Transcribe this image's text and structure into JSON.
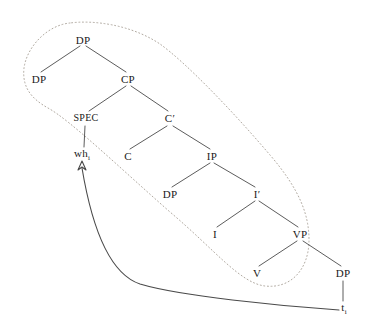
{
  "diagram": {
    "type": "syntax-tree",
    "background_color": "#ffffff",
    "line_color": "#4a4a4a",
    "dotted_color": "#b0a9a0",
    "text_color": "#1a1a1a"
  },
  "nodes": [
    {
      "id": "dp-root",
      "label": "DP",
      "sub": "",
      "x": 83,
      "y": 40
    },
    {
      "id": "dp-left",
      "label": "DP",
      "sub": "",
      "x": 39,
      "y": 79
    },
    {
      "id": "cp",
      "label": "CP",
      "sub": "",
      "x": 128,
      "y": 79
    },
    {
      "id": "spec",
      "label": "SPEC",
      "sub": "",
      "x": 86,
      "y": 118
    },
    {
      "id": "cbar",
      "label": "C′",
      "sub": "",
      "x": 170,
      "y": 118
    },
    {
      "id": "wh",
      "label": "wh",
      "sub": "i",
      "x": 82,
      "y": 155
    },
    {
      "id": "c",
      "label": "C",
      "sub": "",
      "x": 128,
      "y": 156
    },
    {
      "id": "ip",
      "label": "IP",
      "sub": "",
      "x": 212,
      "y": 156
    },
    {
      "id": "dp-subj",
      "label": "DP",
      "sub": "",
      "x": 170,
      "y": 194
    },
    {
      "id": "ibar",
      "label": "I′",
      "sub": "",
      "x": 257,
      "y": 194
    },
    {
      "id": "i",
      "label": "I",
      "sub": "",
      "x": 215,
      "y": 234
    },
    {
      "id": "vp",
      "label": "VP",
      "sub": "",
      "x": 300,
      "y": 234
    },
    {
      "id": "v",
      "label": "V",
      "sub": "",
      "x": 257,
      "y": 273
    },
    {
      "id": "dp-obj",
      "label": "DP",
      "sub": "",
      "x": 343,
      "y": 273
    },
    {
      "id": "trace",
      "label": "t",
      "sub": "i",
      "x": 344,
      "y": 309
    }
  ],
  "branches": [
    {
      "from": "dp-root",
      "to": "dp-left",
      "path": "M 80 46 L 41 72"
    },
    {
      "from": "dp-root",
      "to": "cp",
      "path": "M 86 46 L 126 72"
    },
    {
      "from": "cp",
      "to": "spec",
      "path": "M 126 86 L 89 111"
    },
    {
      "from": "cp",
      "to": "cbar",
      "path": "M 131 86 L 168 111"
    },
    {
      "from": "spec",
      "to": "wh",
      "path": "M 85 126 L 84 147"
    },
    {
      "from": "cbar",
      "to": "c",
      "path": "M 167 126 L 130 149"
    },
    {
      "from": "cbar",
      "to": "ip",
      "path": "M 173 126 L 210 149"
    },
    {
      "from": "ip",
      "to": "dp-subj",
      "path": "M 210 163 L 172 187"
    },
    {
      "from": "ip",
      "to": "ibar",
      "path": "M 214 163 L 255 187"
    },
    {
      "from": "ibar",
      "to": "i",
      "path": "M 255 201 L 217 227"
    },
    {
      "from": "ibar",
      "to": "vp",
      "path": "M 259 201 L 298 227"
    },
    {
      "from": "vp",
      "to": "v",
      "path": "M 297 241 L 259 266"
    },
    {
      "from": "vp",
      "to": "dp-obj",
      "path": "M 303 241 L 341 266"
    },
    {
      "from": "dp-obj",
      "to": "trace",
      "path": "M 343 281 L 343 301"
    }
  ],
  "envelope": {
    "name": "dotted-constituent-envelope",
    "path": "M 70 23 C 48 25 27 46 24 68 C 22 86 30 98 48 108 C 70 120 120 168 170 212 C 215 250 240 283 265 286 C 292 289 309 268 309 240 C 309 215 300 190 270 155 C 230 108 185 62 160 44 C 130 24 92 20 70 23 Z",
    "dash": "1,2.6"
  },
  "movement_arrow": {
    "name": "wh-movement-arrow",
    "from_node": "trace",
    "to_node": "wh",
    "path": "M 339 310 C 280 306 180 296 140 284 C 110 274 92 228 82 168",
    "arrowhead": "M 82 161 L 78 170 L 82 167 L 86 170 Z"
  }
}
